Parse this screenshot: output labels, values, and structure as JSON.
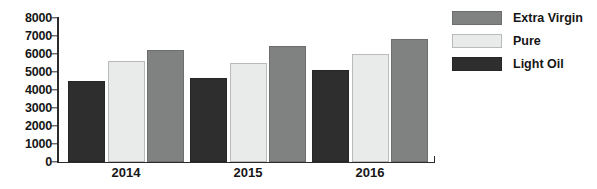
{
  "chart_data": {
    "type": "bar",
    "title": "",
    "subtitle": "",
    "xlabel": "",
    "ylabel": "",
    "categories": [
      "2014",
      "2015",
      "2016"
    ],
    "series": [
      {
        "name": "Light Oil",
        "color": "#2e2e2e",
        "values": [
          4500,
          4650,
          5100
        ]
      },
      {
        "name": "Pure",
        "color": "#e9eaea",
        "values": [
          5600,
          5500,
          6000
        ]
      },
      {
        "name": "Extra Virgin",
        "color": "#808281",
        "values": [
          6200,
          6400,
          6800
        ]
      }
    ],
    "ylim": [
      0,
      8000
    ],
    "ytick_step": 1000,
    "yticks": [
      "0",
      "1000",
      "2000",
      "3000",
      "4000",
      "5000",
      "6000",
      "7000",
      "8000"
    ],
    "grid": false,
    "legend_position": "right",
    "legend_order": [
      "Extra Virgin",
      "Pure",
      "Light Oil"
    ],
    "bar_order_in_group": [
      "Light Oil",
      "Pure",
      "Extra Virgin"
    ]
  },
  "legend": {
    "items": [
      {
        "label": "Extra Virgin",
        "swatch": "extra-virgin"
      },
      {
        "label": "Pure",
        "swatch": "pure"
      },
      {
        "label": "Light Oil",
        "swatch": "light-oil"
      }
    ]
  },
  "axis": {
    "y_ticks": [
      "8000",
      "7000",
      "6000",
      "5000",
      "4000",
      "3000",
      "2000",
      "1000",
      "0"
    ],
    "x_ticks": [
      "2014",
      "2015",
      "2016"
    ]
  },
  "colors": {
    "extra_virgin": "#808281",
    "pure": "#e9eaea",
    "light_oil": "#2e2e2e",
    "axis": "#2b2b2b",
    "text": "#161616",
    "background": "#ffffff"
  }
}
